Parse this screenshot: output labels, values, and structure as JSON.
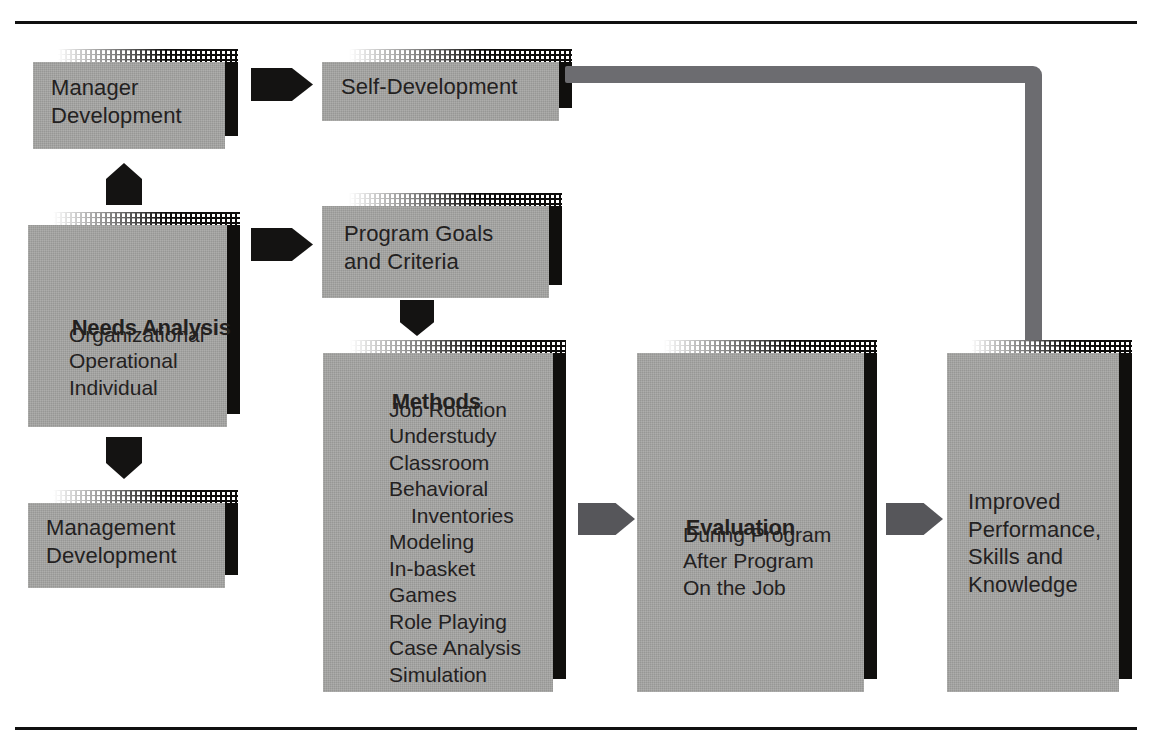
{
  "diagram": {
    "colors": {
      "box_face": "#a5a5a3",
      "box_shadow": "#100f0d",
      "arrow_black": "#141312",
      "arrow_gray": "#56565a",
      "connector_gray": "#6c6c70",
      "rule": "#101010",
      "text": "#23211f",
      "background": "#ffffff"
    },
    "rules": {
      "top_label": "top-divider-rule",
      "bottom_label": "bottom-divider-rule"
    },
    "nodes": [
      {
        "id": "manager-development",
        "lines": [
          "Manager",
          "Development"
        ],
        "heading": ""
      },
      {
        "id": "self-development",
        "lines": [
          "Self-Development"
        ],
        "heading": ""
      },
      {
        "id": "needs-analysis",
        "heading": "Needs Analysis",
        "lines": [
          "Organizational",
          "Operational",
          "Individual"
        ]
      },
      {
        "id": "management-development",
        "lines": [
          "Management",
          "Development"
        ],
        "heading": ""
      },
      {
        "id": "program-goals",
        "lines": [
          "Program Goals",
          "and Criteria"
        ],
        "heading": ""
      },
      {
        "id": "methods",
        "heading": "Methods",
        "lines": [
          "Job Rotation",
          "Understudy",
          "Classroom",
          "Behavioral",
          "  Inventories",
          "Modeling",
          "In-basket",
          "Games",
          "Role Playing",
          "Case Analysis",
          "Simulation"
        ]
      },
      {
        "id": "evaluation",
        "heading": "Evaluation",
        "lines": [
          "During Program",
          "After Program",
          "On the Job"
        ]
      },
      {
        "id": "improved-results",
        "heading": "",
        "lines": [
          "Improved",
          "Performance,",
          "Skills and",
          "Knowledge"
        ]
      }
    ],
    "connectors": [
      {
        "id": "manager-to-self",
        "type": "arrow-right",
        "style": "black"
      },
      {
        "id": "needs-up-to-manager",
        "type": "arrow-up",
        "style": "black"
      },
      {
        "id": "needs-down-to-mgmt",
        "type": "arrow-down",
        "style": "black"
      },
      {
        "id": "needs-to-program-goals",
        "type": "arrow-right",
        "style": "black"
      },
      {
        "id": "goals-to-methods",
        "type": "arrow-down",
        "style": "black"
      },
      {
        "id": "methods-to-evaluation",
        "type": "arrow-right",
        "style": "gray"
      },
      {
        "id": "evaluation-to-improved",
        "type": "arrow-right",
        "style": "gray"
      },
      {
        "id": "self-development-to-improved",
        "type": "elbow",
        "style": "gray"
      }
    ]
  },
  "nodes": {
    "manager_development": {
      "line1": "Manager",
      "line2": "Development"
    },
    "self_development": {
      "line1": "Self-Development"
    },
    "needs_analysis": {
      "heading": "Needs Analysis",
      "line1": "Organizational",
      "line2": "Operational",
      "line3": "Individual"
    },
    "management_development": {
      "line1": "Management",
      "line2": "Development"
    },
    "program_goals": {
      "line1": "Program Goals",
      "line2": "and Criteria"
    },
    "methods": {
      "heading": "Methods",
      "item1": "Job Rotation",
      "item2": "Understudy",
      "item3": "Classroom",
      "item4": "Behavioral",
      "item5": "Inventories",
      "item6": "Modeling",
      "item7": "In-basket",
      "item8": "Games",
      "item9": "Role Playing",
      "item10": "Case Analysis",
      "item11": "Simulation"
    },
    "evaluation": {
      "heading": "Evaluation",
      "item1": "During Program",
      "item2": "After Program",
      "item3": "On the Job"
    },
    "improved_results": {
      "line1": "Improved",
      "line2": "Performance,",
      "line3": "Skills and",
      "line4": "Knowledge"
    }
  }
}
